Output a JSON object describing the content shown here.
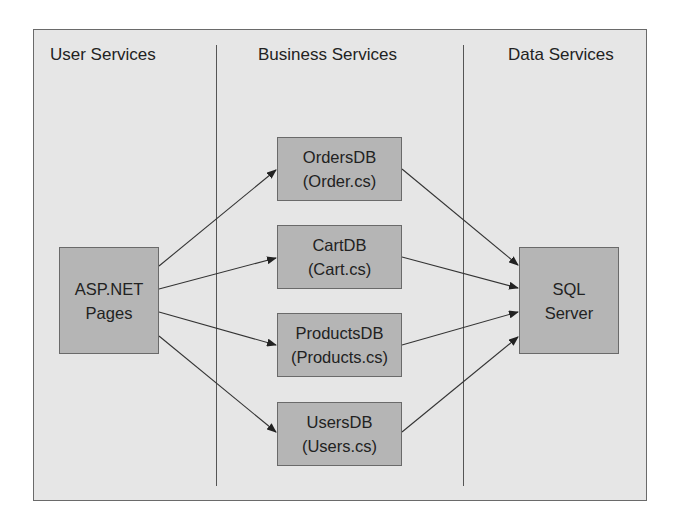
{
  "columns": [
    {
      "heading": "User Services"
    },
    {
      "heading": "Business Services"
    },
    {
      "heading": "Data Services"
    }
  ],
  "nodes": {
    "aspnet": {
      "line1": "ASP.NET",
      "line2": "Pages"
    },
    "orders": {
      "line1": "OrdersDB",
      "line2": "(Order.cs)"
    },
    "cart": {
      "line1": "CartDB",
      "line2": "(Cart.cs)"
    },
    "products": {
      "line1": "ProductsDB",
      "line2": "(Products.cs)"
    },
    "users": {
      "line1": "UsersDB",
      "line2": "(Users.cs)"
    },
    "sql": {
      "line1": "SQL",
      "line2": "Server"
    }
  },
  "edges": [
    {
      "from": "aspnet",
      "to": "orders"
    },
    {
      "from": "aspnet",
      "to": "cart"
    },
    {
      "from": "aspnet",
      "to": "products"
    },
    {
      "from": "aspnet",
      "to": "users"
    },
    {
      "from": "orders",
      "to": "sql"
    },
    {
      "from": "cart",
      "to": "sql"
    },
    {
      "from": "products",
      "to": "sql"
    },
    {
      "from": "users",
      "to": "sql"
    }
  ],
  "colors": {
    "background": "#e6e6e6",
    "box": "#b5b5b5",
    "line": "#333333"
  }
}
